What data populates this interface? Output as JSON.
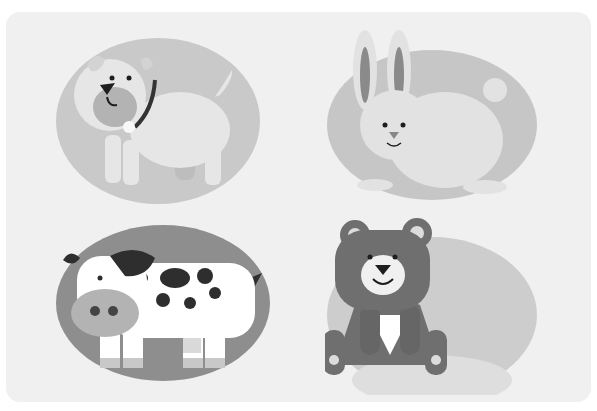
{
  "image": {
    "description": "Grayscale illustration of four cartoon animals, each inside an oval",
    "background_color": "#f0f0f0",
    "panels": [
      {
        "animal": "dog",
        "position": "top-left",
        "oval_color": "#c9c9c9",
        "body_color": "#e6e6e6"
      },
      {
        "animal": "rabbit",
        "position": "top-right",
        "oval_color": "#c6c6c6",
        "body_color": "#e2e2e2"
      },
      {
        "animal": "cow",
        "position": "bottom-left",
        "oval_color": "#8e8e8e",
        "body_color": "#ffffff",
        "spot_color": "#2e2e2e"
      },
      {
        "animal": "bear",
        "position": "bottom-right",
        "oval_color": "#cdcdcd",
        "body_color": "#6f6f6f"
      }
    ]
  }
}
